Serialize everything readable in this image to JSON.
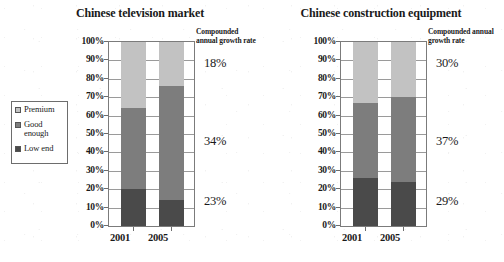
{
  "legend": {
    "items": [
      {
        "label": "Premium",
        "color": "#c2c2c2",
        "key": "premium"
      },
      {
        "label": "Good\nenough",
        "color": "#7d7d7d",
        "key": "good"
      },
      {
        "label": "Low end",
        "color": "#4a4a4a",
        "key": "low"
      }
    ]
  },
  "cagr_header": "Compounded annual\ngrowth rate",
  "axis": {
    "yticks": [
      "100%",
      "90%",
      "80%",
      "70%",
      "60%",
      "50%",
      "40%",
      "30%",
      "20%",
      "10%",
      "0%"
    ],
    "ylim": [
      0,
      100
    ]
  },
  "charts": [
    {
      "title": "Chinese television market",
      "categories": [
        "2001",
        "2005"
      ],
      "cagr": {
        "premium": "18%",
        "good": "34%",
        "low": "23%"
      }
    },
    {
      "title": "Chinese construction equipment",
      "categories": [
        "2001",
        "2005"
      ],
      "cagr": {
        "premium": "30%",
        "good": "37%",
        "low": "29%"
      }
    }
  ],
  "chart_data": [
    {
      "type": "bar",
      "title": "Chinese television market",
      "subtitle": "",
      "xlabel": "",
      "ylabel": "",
      "categories": [
        "2001",
        "2005"
      ],
      "stacked": true,
      "ylim": [
        0,
        100
      ],
      "ytick_labels": [
        "0%",
        "10%",
        "20%",
        "30%",
        "40%",
        "50%",
        "60%",
        "70%",
        "80%",
        "90%",
        "100%"
      ],
      "grid": true,
      "legend_position": "left-outside",
      "series": [
        {
          "name": "Low end",
          "color": "#4a4a4a",
          "values": [
            20,
            14
          ]
        },
        {
          "name": "Good enough",
          "color": "#7d7d7d",
          "values": [
            44,
            62
          ]
        },
        {
          "name": "Premium",
          "color": "#c2c2c2",
          "values": [
            36,
            24
          ]
        }
      ],
      "annotations": {
        "label": "Compounded annual growth rate",
        "values": {
          "Premium": "18%",
          "Good enough": "34%",
          "Low end": "23%"
        }
      }
    },
    {
      "type": "bar",
      "title": "Chinese construction equipment",
      "subtitle": "",
      "xlabel": "",
      "ylabel": "",
      "categories": [
        "2001",
        "2005"
      ],
      "stacked": true,
      "ylim": [
        0,
        100
      ],
      "ytick_labels": [
        "0%",
        "10%",
        "20%",
        "30%",
        "40%",
        "50%",
        "60%",
        "70%",
        "80%",
        "90%",
        "100%"
      ],
      "grid": true,
      "legend_position": "left-outside",
      "series": [
        {
          "name": "Low end",
          "color": "#4a4a4a",
          "values": [
            26,
            24
          ]
        },
        {
          "name": "Good enough",
          "color": "#7d7d7d",
          "values": [
            41,
            46
          ]
        },
        {
          "name": "Premium",
          "color": "#c2c2c2",
          "values": [
            33,
            30
          ]
        }
      ],
      "annotations": {
        "label": "Compounded annual growth rate",
        "values": {
          "Premium": "30%",
          "Good enough": "37%",
          "Low end": "29%"
        }
      }
    }
  ]
}
